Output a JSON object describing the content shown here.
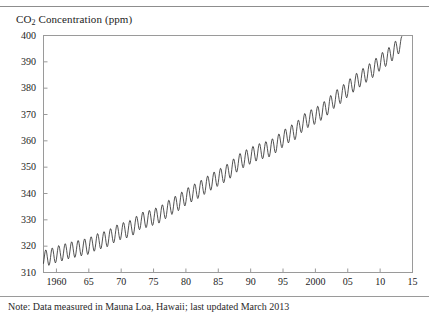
{
  "figure": {
    "caption": "Note: Data measured in Mauna Loa, Hawaii; last updated March 2013"
  },
  "chart_data": {
    "type": "line",
    "title": "CO2 Concentration (ppm)",
    "title_parts": {
      "pre": "CO",
      "sub": "2",
      "post": " Concentration (ppm)"
    },
    "xlabel": "",
    "ylabel": "CO2 Concentration (ppm)",
    "xlim": [
      1958,
      2015
    ],
    "ylim": [
      310,
      400
    ],
    "grid": false,
    "legend": false,
    "line_color": "#333333",
    "frame_color": "#9a9a9a",
    "ytick_labels": [
      "400",
      "390",
      "380",
      "370",
      "360",
      "350",
      "340",
      "330",
      "320",
      "310"
    ],
    "ytick_values": [
      400,
      390,
      380,
      370,
      360,
      350,
      340,
      330,
      320,
      310
    ],
    "xtick_labels": [
      "1960",
      "65",
      "70",
      "75",
      "80",
      "85",
      "90",
      "95",
      "2000",
      "05",
      "10",
      "15"
    ],
    "xtick_values": [
      1960,
      1965,
      1970,
      1975,
      1980,
      1985,
      1990,
      1995,
      2000,
      2005,
      2010,
      2015
    ],
    "seasonal_amplitude": 3.1,
    "series": [
      {
        "name": "CO2 annual mean (ppm)",
        "x": [
          1958,
          1959,
          1960,
          1961,
          1962,
          1963,
          1964,
          1965,
          1966,
          1967,
          1968,
          1969,
          1970,
          1971,
          1972,
          1973,
          1974,
          1975,
          1976,
          1977,
          1978,
          1979,
          1980,
          1981,
          1982,
          1983,
          1984,
          1985,
          1986,
          1987,
          1988,
          1989,
          1990,
          1991,
          1992,
          1993,
          1994,
          1995,
          1996,
          1997,
          1998,
          1999,
          2000,
          2001,
          2002,
          2003,
          2004,
          2005,
          2006,
          2007,
          2008,
          2009,
          2010,
          2011,
          2012,
          2013
        ],
        "values": [
          315.3,
          315.9,
          316.9,
          317.6,
          318.4,
          318.9,
          319.5,
          320.0,
          321.4,
          322.2,
          323.0,
          324.6,
          325.7,
          326.3,
          327.5,
          329.7,
          330.2,
          331.1,
          332.0,
          333.8,
          335.4,
          336.8,
          338.7,
          340.1,
          341.4,
          343.0,
          344.6,
          346.0,
          347.4,
          349.2,
          351.6,
          353.1,
          354.4,
          355.6,
          356.4,
          357.1,
          358.8,
          360.8,
          362.6,
          363.7,
          366.7,
          368.4,
          369.5,
          371.1,
          373.2,
          375.8,
          377.5,
          379.8,
          381.9,
          383.8,
          385.6,
          387.4,
          389.9,
          391.6,
          393.8,
          396.5
        ]
      }
    ]
  }
}
